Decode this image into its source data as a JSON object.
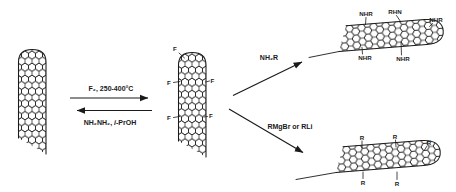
{
  "figure": {
    "background": "#ffffff",
    "ink": "#1a1a1a"
  },
  "reactions": {
    "fluorination": {
      "label": "F₂, 250-400°C"
    },
    "defluorination": {
      "prefix": "NH₂NH₂, ",
      "italic": "i",
      "suffix": "-PrOH"
    },
    "amination": {
      "label": "NH₂R"
    },
    "alkylation": {
      "label": "RMgBr or RLi"
    }
  },
  "molecules": {
    "fluorinated_nanotube": {
      "substituents": [
        "F",
        "F",
        "F",
        "F",
        "F"
      ]
    },
    "aminated_nanotube": {
      "substituents": [
        "NHR",
        "RHN",
        "NHR",
        "NHR",
        "NHR"
      ]
    },
    "alkylated_nanotube": {
      "substituents": [
        "R",
        "R",
        "R",
        "R",
        "R"
      ]
    }
  }
}
